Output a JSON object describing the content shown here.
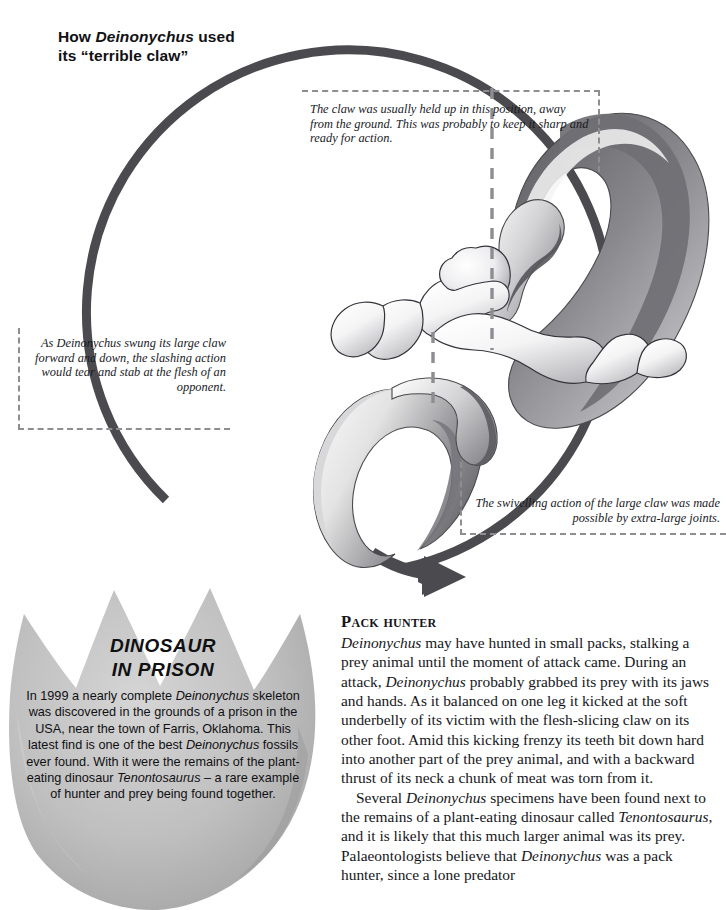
{
  "page": {
    "title_prefix": "How ",
    "title_species": "Deinonychus",
    "title_suffix": " used",
    "title_line2": "its “terrible claw”"
  },
  "callouts": [
    {
      "id": "claw-held-up",
      "name": "callout-claw-held-up",
      "text": "The claw was usually held up in this position, away from the ground. This was probably to keep it sharp and ready for action."
    },
    {
      "id": "slashing-action",
      "name": "callout-slashing-action",
      "text": "As Deinonychus swung its large claw forward and down, the slashing action would tear and stab at the flesh of an opponent."
    },
    {
      "id": "swivelling-joints",
      "name": "callout-swivelling-joints",
      "text": "The swivelling action of the large claw was made possible by extra-large joints."
    }
  ],
  "prison_panel": {
    "heading_line1": "DINOSAUR",
    "heading_line2": "IN PRISON",
    "body_part1": "In 1999 a nearly complete ",
    "body_species1": "Deinonychus",
    "body_part2": " skeleton was discovered in the grounds of a prison in the USA, near the town of Farris, Oklahoma. This latest find is one of the best ",
    "body_species2": "Deinonychus",
    "body_part3": " fossils ever found. With it were the remains of the plant-eating dinosaur ",
    "body_species3": "Tenontosaurus",
    "body_part4": " – a rare example of hunter and prey being found together."
  },
  "article": {
    "heading": "Pack hunter",
    "p1_a": "",
    "p1_species1": "Deinonychus",
    "p1_b": " may have hunted in small packs, stalking a prey animal until the moment of attack came. During an attack, ",
    "p1_species2": "Deinonychus",
    "p1_c": " probably grabbed its prey with its jaws and hands. As it balanced on one leg it kicked at the soft underbelly of its victim with the flesh-slicing claw on its other foot. Amid this kicking frenzy its teeth bit down hard into another part of the prey animal, and with a backward thrust of its neck a chunk of meat was torn from it.",
    "p2_a": "Several ",
    "p2_species1": "Deinonychus",
    "p2_b": " specimens have been found next to the remains of a plant-eating dinosaur called ",
    "p2_species2": "Tenontosaurus",
    "p2_c": ", and it is likely that this much larger animal was its prey. Palaeontologists believe that ",
    "p2_species3": "Deinonychus",
    "p2_d": " was a pack hunter, since a lone predator"
  },
  "colors": {
    "arrow": "#4b4b4f",
    "dashed_border": "#8d8d92",
    "panel_fill": "#b9b9b9",
    "text": "#16161a",
    "claw_dark": "#6c6c70",
    "claw_light": "#efefef",
    "bone_outline": "#33333a"
  }
}
